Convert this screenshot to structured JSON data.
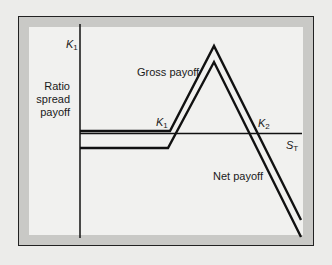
{
  "diagram": {
    "title": "Ratio spread payoff",
    "y_axis_label": "Ratio spread payoff",
    "y_axis_tick": {
      "symbol": "K",
      "subscript": "1"
    },
    "x_axis_label": {
      "symbol": "S",
      "subscript": "T"
    },
    "strike_labels": [
      {
        "symbol": "K",
        "subscript": "1"
      },
      {
        "symbol": "K",
        "subscript": "2"
      }
    ],
    "curve_labels": {
      "gross": "Gross payoff",
      "net": "Net payoff"
    },
    "series": [
      {
        "name": "Gross payoff",
        "points": [
          [
            80,
            131
          ],
          [
            170,
            131
          ],
          [
            214,
            46
          ],
          [
            301,
            220
          ]
        ]
      },
      {
        "name": "Net payoff",
        "points": [
          [
            80,
            148
          ],
          [
            168,
            148
          ],
          [
            214,
            62
          ],
          [
            301,
            237
          ]
        ]
      }
    ],
    "colors": {
      "line": "#111111",
      "frame_band": "#c9c9c6",
      "plot_bg": "#f1f1ef"
    }
  }
}
